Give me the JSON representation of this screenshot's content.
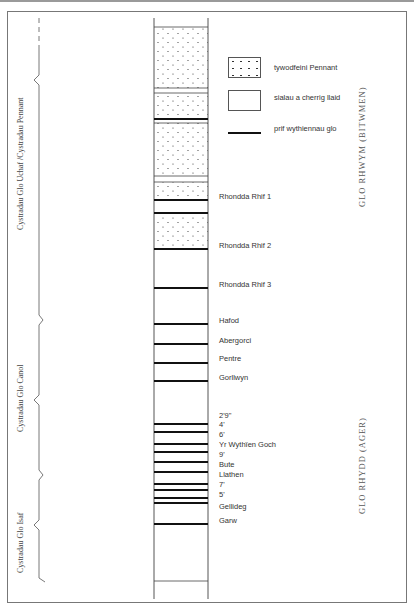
{
  "legend": {
    "items": [
      {
        "label": "tywodfeini Pennant",
        "symbol": "dotted-box"
      },
      {
        "label": "sialau a cherrig llaid",
        "symbol": "empty-box"
      },
      {
        "label": "prif wythiennau glo",
        "symbol": "thick-line"
      }
    ]
  },
  "left_groups": [
    {
      "label": "Cystradau Glo Uchaf /Cystradau Pennant"
    },
    {
      "label": "Cystradau Glo Canol"
    },
    {
      "label": "Cystradau Glo Isaf"
    }
  ],
  "right_groups": [
    {
      "label": "GLO RHWYM (BITWMEN)"
    },
    {
      "label": "GLO RHYDD (AGER)"
    }
  ],
  "seams": [
    {
      "label": "Rhondda Rhif 1"
    },
    {
      "label": "Rhondda Rhif 2"
    },
    {
      "label": "Rhondda Rhif 3"
    },
    {
      "label": "Hafod"
    },
    {
      "label": "Abergorci"
    },
    {
      "label": "Pentre"
    },
    {
      "label": "Gorllwyn"
    },
    {
      "label": "2'9\""
    },
    {
      "label": "4'"
    },
    {
      "label": "6'"
    },
    {
      "label": "Yr Wythïen Goch"
    },
    {
      "label": "9'"
    },
    {
      "label": "Bute"
    },
    {
      "label": "Llathen"
    },
    {
      "label": "7'"
    },
    {
      "label": "5'"
    },
    {
      "label": "Gellideg"
    },
    {
      "label": "Garw"
    }
  ],
  "colors": {
    "line": "#111111",
    "frame": "#777777",
    "text": "#333333"
  }
}
